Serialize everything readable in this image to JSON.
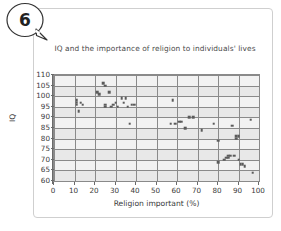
{
  "badge": {
    "number": "6",
    "icon": "speech-bubble-icon"
  },
  "chart_data": {
    "type": "scatter",
    "title": "IQ and the importance of religion to individuals' lives",
    "xlabel": "Religion important (%)",
    "ylabel": "IQ",
    "xlim": [
      0,
      100
    ],
    "ylim": [
      60,
      110
    ],
    "grid": true,
    "legend": "none",
    "xticks": [
      "0",
      "10",
      "20",
      "30",
      "40",
      "50",
      "60",
      "70",
      "80",
      "90",
      "100"
    ],
    "xtick_values": [
      0,
      10,
      20,
      30,
      40,
      50,
      60,
      70,
      80,
      90,
      100
    ],
    "yticks": [
      "60",
      "65",
      "70",
      "75",
      "80",
      "85",
      "90",
      "95",
      "100",
      "105",
      "110"
    ],
    "ytick_values": [
      60,
      65,
      70,
      75,
      80,
      85,
      90,
      95,
      100,
      105,
      110
    ],
    "point_color": "#5b5b5b",
    "plot_background": "#f2f2f2",
    "grid_color": "#8a8a8a",
    "series": [
      {
        "name": "Countries",
        "x": [
          11,
          11,
          11,
          12,
          13,
          14,
          21,
          22,
          24,
          25,
          25,
          25,
          27,
          28,
          29,
          30,
          31,
          33,
          34,
          35,
          36,
          37,
          38,
          39,
          57,
          58,
          59,
          61,
          62,
          64,
          66,
          68,
          72,
          78,
          80,
          80,
          83,
          84,
          85,
          85,
          86,
          87,
          88,
          89,
          89,
          90,
          90,
          91,
          92,
          93,
          96,
          97
        ],
        "y": [
          97,
          98,
          96,
          93,
          97,
          96,
          102,
          101,
          106,
          105,
          96,
          95,
          102,
          95,
          96,
          97,
          95,
          99,
          97,
          99,
          95,
          87,
          96,
          96,
          87,
          98,
          87,
          88,
          88,
          85,
          90,
          90,
          84,
          87,
          79,
          69,
          70,
          71,
          72,
          71,
          72,
          86,
          72,
          80,
          81,
          81,
          70,
          68,
          68,
          67,
          89,
          64
        ]
      }
    ]
  }
}
